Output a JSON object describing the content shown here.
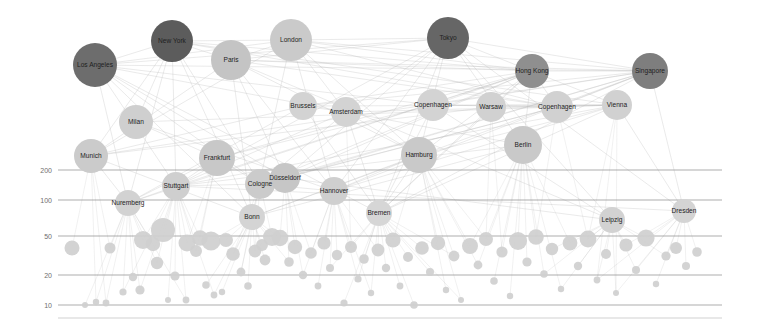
{
  "chart_data": {
    "type": "scatter",
    "title": "",
    "xlabel": "",
    "ylabel": "",
    "ylim": [
      8,
      260
    ],
    "yscale": "log",
    "grid": true,
    "legend_position": "none",
    "y_ticks": [
      {
        "label": "200",
        "value": 200,
        "y": 170
      },
      {
        "label": "100",
        "value": 100,
        "y": 200
      },
      {
        "label": "50",
        "value": 50,
        "y": 236
      },
      {
        "label": "20",
        "value": 20,
        "y": 275
      },
      {
        "label": "10",
        "value": 10,
        "y": 305
      }
    ],
    "grid_x_start": 58,
    "grid_x_end": 722,
    "baselines": [
      318
    ],
    "labeled_nodes": [
      {
        "label": "Los Angeles",
        "x": 95,
        "y": 65,
        "r": 22,
        "color": "#6d6d6d",
        "tier": "global"
      },
      {
        "label": "New York",
        "x": 172,
        "y": 41,
        "r": 21,
        "color": "#5c5c5c",
        "tier": "global"
      },
      {
        "label": "Paris",
        "x": 231,
        "y": 60,
        "r": 20,
        "color": "#c4c4c4",
        "tier": "global"
      },
      {
        "label": "London",
        "x": 291,
        "y": 40,
        "r": 21,
        "color": "#cacaca",
        "tier": "global"
      },
      {
        "label": "Tokyo",
        "x": 448,
        "y": 38,
        "r": 21,
        "color": "#666666",
        "tier": "global"
      },
      {
        "label": "Hong Kong",
        "x": 532,
        "y": 71,
        "r": 17,
        "color": "#8f8f8f",
        "tier": "global"
      },
      {
        "label": "Singapore",
        "x": 650,
        "y": 71,
        "r": 18,
        "color": "#7e7e7e",
        "tier": "global"
      },
      {
        "label": "Milan",
        "x": 136,
        "y": 122,
        "r": 17,
        "color": "#cfcfcf",
        "tier": "regional"
      },
      {
        "label": "Brussels",
        "x": 303,
        "y": 106,
        "r": 14,
        "color": "#d3d3d3",
        "tier": "regional"
      },
      {
        "label": "Amsterdam",
        "x": 346,
        "y": 112,
        "r": 15,
        "color": "#d3d3d3",
        "tier": "regional"
      },
      {
        "label": "Copenhagen",
        "x": 433,
        "y": 105,
        "r": 16,
        "color": "#d3d3d3",
        "tier": "regional"
      },
      {
        "label": "Warsaw",
        "x": 491,
        "y": 107,
        "r": 15,
        "color": "#d1d1d1",
        "tier": "regional"
      },
      {
        "label": "Copenhagen",
        "x": 557,
        "y": 107,
        "r": 16,
        "color": "#d1d1d1",
        "tier": "regional"
      },
      {
        "label": "Vienna",
        "x": 617,
        "y": 105,
        "r": 15,
        "color": "#d1d1d1",
        "tier": "regional"
      },
      {
        "label": "Munich",
        "x": 91,
        "y": 156,
        "r": 17,
        "color": "#cbcbcb",
        "tier": "hub"
      },
      {
        "label": "Frankfurt",
        "x": 217,
        "y": 158,
        "r": 18,
        "color": "#c8c8c8",
        "tier": "hub"
      },
      {
        "label": "Hamburg",
        "x": 419,
        "y": 155,
        "r": 18,
        "color": "#c9c9c9",
        "tier": "hub"
      },
      {
        "label": "Berlin",
        "x": 523,
        "y": 145,
        "r": 19,
        "color": "#c9c9c9",
        "tier": "hub"
      },
      {
        "label": "Stuttgart",
        "x": 176,
        "y": 186,
        "r": 14,
        "color": "#cfcfcf",
        "tier": "hub"
      },
      {
        "label": "Cologne",
        "x": 260,
        "y": 184,
        "r": 15,
        "color": "#cbcbcb",
        "tier": "hub"
      },
      {
        "label": "Düsseldorf",
        "x": 285,
        "y": 178,
        "r": 15,
        "color": "#c6c6c6",
        "tier": "hub"
      },
      {
        "label": "Hannover",
        "x": 334,
        "y": 191,
        "r": 14,
        "color": "#cfcfcf",
        "tier": "hub"
      },
      {
        "label": "Nuremberg",
        "x": 128,
        "y": 203,
        "r": 13,
        "color": "#d2d2d2",
        "tier": "hub"
      },
      {
        "label": "Bonn",
        "x": 252,
        "y": 217,
        "r": 13,
        "color": "#d4d4d4",
        "tier": "hub"
      },
      {
        "label": "Bremen",
        "x": 379,
        "y": 213,
        "r": 13,
        "color": "#d6d6d6",
        "tier": "hub"
      },
      {
        "label": "Leipzig",
        "x": 612,
        "y": 220,
        "r": 13,
        "color": "#d2d2d2",
        "tier": "hub"
      },
      {
        "label": "Dresden",
        "x": 684,
        "y": 211,
        "r": 12,
        "color": "#d4d4d4",
        "tier": "hub"
      }
    ],
    "scatter_nodes": [
      {
        "x": 72,
        "y": 248,
        "r": 7.5
      },
      {
        "x": 85,
        "y": 305,
        "r": 3.0
      },
      {
        "x": 96,
        "y": 302,
        "r": 3.2
      },
      {
        "x": 106,
        "y": 303,
        "r": 3.4
      },
      {
        "x": 110,
        "y": 248,
        "r": 5.5
      },
      {
        "x": 123,
        "y": 292,
        "r": 3.6
      },
      {
        "x": 133,
        "y": 277,
        "r": 4.2
      },
      {
        "x": 140,
        "y": 290,
        "r": 4.6
      },
      {
        "x": 143,
        "y": 240,
        "r": 9.0
      },
      {
        "x": 153,
        "y": 244,
        "r": 7.2
      },
      {
        "x": 157,
        "y": 263,
        "r": 6.2
      },
      {
        "x": 163,
        "y": 230,
        "r": 12.0
      },
      {
        "x": 168,
        "y": 300,
        "r": 3.0
      },
      {
        "x": 175,
        "y": 276,
        "r": 4.6
      },
      {
        "x": 186,
        "y": 300,
        "r": 3.4
      },
      {
        "x": 187,
        "y": 243,
        "r": 8.5
      },
      {
        "x": 196,
        "y": 251,
        "r": 6.0
      },
      {
        "x": 200,
        "y": 238,
        "r": 7.8
      },
      {
        "x": 206,
        "y": 285,
        "r": 3.8
      },
      {
        "x": 211,
        "y": 241,
        "r": 9.5
      },
      {
        "x": 214,
        "y": 295,
        "r": 3.4
      },
      {
        "x": 222,
        "y": 292,
        "r": 3.2
      },
      {
        "x": 226,
        "y": 240,
        "r": 7.0
      },
      {
        "x": 233,
        "y": 254,
        "r": 6.8
      },
      {
        "x": 241,
        "y": 272,
        "r": 4.4
      },
      {
        "x": 248,
        "y": 286,
        "r": 3.8
      },
      {
        "x": 255,
        "y": 251,
        "r": 6.4
      },
      {
        "x": 262,
        "y": 245,
        "r": 6.0
      },
      {
        "x": 265,
        "y": 260,
        "r": 5.4
      },
      {
        "x": 272,
        "y": 237,
        "r": 9.0
      },
      {
        "x": 280,
        "y": 238,
        "r": 8.2
      },
      {
        "x": 289,
        "y": 262,
        "r": 4.8
      },
      {
        "x": 295,
        "y": 247,
        "r": 7.2
      },
      {
        "x": 303,
        "y": 275,
        "r": 4.2
      },
      {
        "x": 311,
        "y": 253,
        "r": 5.8
      },
      {
        "x": 318,
        "y": 286,
        "r": 3.4
      },
      {
        "x": 324,
        "y": 243,
        "r": 6.6
      },
      {
        "x": 330,
        "y": 268,
        "r": 4.0
      },
      {
        "x": 337,
        "y": 255,
        "r": 5.2
      },
      {
        "x": 344,
        "y": 303,
        "r": 3.6
      },
      {
        "x": 351,
        "y": 247,
        "r": 6.0
      },
      {
        "x": 358,
        "y": 279,
        "r": 3.6
      },
      {
        "x": 364,
        "y": 259,
        "r": 4.8
      },
      {
        "x": 371,
        "y": 293,
        "r": 3.2
      },
      {
        "x": 378,
        "y": 250,
        "r": 6.4
      },
      {
        "x": 386,
        "y": 268,
        "r": 4.2
      },
      {
        "x": 393,
        "y": 240,
        "r": 7.6
      },
      {
        "x": 400,
        "y": 286,
        "r": 3.4
      },
      {
        "x": 408,
        "y": 257,
        "r": 5.0
      },
      {
        "x": 414,
        "y": 305,
        "r": 3.8
      },
      {
        "x": 422,
        "y": 248,
        "r": 6.8
      },
      {
        "x": 430,
        "y": 272,
        "r": 4.0
      },
      {
        "x": 438,
        "y": 243,
        "r": 7.2
      },
      {
        "x": 446,
        "y": 290,
        "r": 3.2
      },
      {
        "x": 454,
        "y": 256,
        "r": 5.4
      },
      {
        "x": 461,
        "y": 300,
        "r": 3.0
      },
      {
        "x": 470,
        "y": 246,
        "r": 8.0
      },
      {
        "x": 478,
        "y": 265,
        "r": 4.4
      },
      {
        "x": 486,
        "y": 239,
        "r": 7.0
      },
      {
        "x": 494,
        "y": 281,
        "r": 3.8
      },
      {
        "x": 502,
        "y": 252,
        "r": 5.6
      },
      {
        "x": 510,
        "y": 296,
        "r": 3.2
      },
      {
        "x": 518,
        "y": 241,
        "r": 9.0
      },
      {
        "x": 527,
        "y": 262,
        "r": 4.6
      },
      {
        "x": 536,
        "y": 237,
        "r": 7.8
      },
      {
        "x": 544,
        "y": 274,
        "r": 3.8
      },
      {
        "x": 552,
        "y": 249,
        "r": 6.2
      },
      {
        "x": 561,
        "y": 289,
        "r": 3.2
      },
      {
        "x": 570,
        "y": 243,
        "r": 7.4
      },
      {
        "x": 578,
        "y": 266,
        "r": 4.2
      },
      {
        "x": 588,
        "y": 239,
        "r": 8.4
      },
      {
        "x": 597,
        "y": 280,
        "r": 3.4
      },
      {
        "x": 606,
        "y": 254,
        "r": 5.0
      },
      {
        "x": 616,
        "y": 293,
        "r": 3.0
      },
      {
        "x": 626,
        "y": 245,
        "r": 6.6
      },
      {
        "x": 636,
        "y": 270,
        "r": 4.0
      },
      {
        "x": 646,
        "y": 238,
        "r": 8.6
      },
      {
        "x": 656,
        "y": 284,
        "r": 3.2
      },
      {
        "x": 666,
        "y": 256,
        "r": 4.6
      },
      {
        "x": 676,
        "y": 248,
        "r": 6.0
      },
      {
        "x": 686,
        "y": 266,
        "r": 4.0
      },
      {
        "x": 697,
        "y": 252,
        "r": 4.8
      }
    ]
  }
}
